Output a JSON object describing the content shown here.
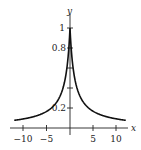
{
  "chart_data": {
    "type": "line",
    "title": "",
    "function": "y = 1/(1+|x|)",
    "xlabel": "x",
    "ylabel": "y",
    "xlim": [
      -12.5,
      12.5
    ],
    "ylim": [
      0,
      1.05
    ],
    "grid": false,
    "legend": null,
    "x_ticks": [
      -10,
      -5,
      5,
      10
    ],
    "x_tick_labels": [
      "−10",
      "−5",
      "5",
      "10"
    ],
    "y_ticks": [
      0.2,
      0.4,
      0.6,
      0.8,
      1
    ],
    "y_tick_labels": [
      "0.2",
      "",
      "",
      "0.8",
      "1"
    ],
    "series": [
      {
        "name": "curve",
        "x": [
          -12,
          -10,
          -8,
          -6,
          -5,
          -4,
          -3,
          -2,
          -1.5,
          -1,
          -0.5,
          0,
          0.5,
          1,
          1.5,
          2,
          3,
          4,
          5,
          6,
          8,
          10,
          12
        ],
        "values": [
          0.077,
          0.091,
          0.111,
          0.143,
          0.167,
          0.2,
          0.25,
          0.333,
          0.4,
          0.5,
          0.667,
          1,
          0.667,
          0.5,
          0.4,
          0.333,
          0.25,
          0.2,
          0.167,
          0.143,
          0.111,
          0.091,
          0.077
        ]
      }
    ]
  },
  "labels": {
    "x_axis": "x",
    "y_axis": "y",
    "xt_m10": "−10",
    "xt_m5": "−5",
    "xt_5": "5",
    "xt_10": "10",
    "yt_1": "1",
    "yt_08": "0.8",
    "yt_02": "0.2"
  }
}
